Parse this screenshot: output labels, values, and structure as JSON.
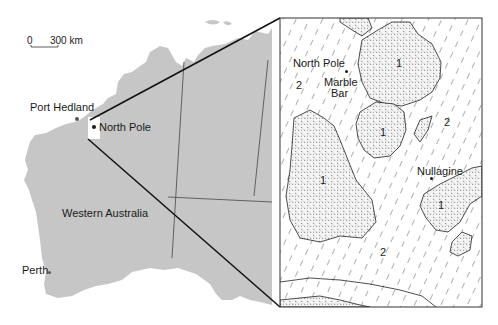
{
  "figure": {
    "overview_map": {
      "region_label": "Western Australia",
      "scale_bar": {
        "start": "0",
        "end": "300 km"
      },
      "places": [
        {
          "name": "Port Hedland"
        },
        {
          "name": "North Pole"
        },
        {
          "name": "Perth"
        }
      ],
      "colors": {
        "land": "#c6c6c6",
        "border": "#555555",
        "inset_marker": "#ffffff"
      }
    },
    "inset_map": {
      "places": [
        {
          "name": "North Pole"
        },
        {
          "name": "Marble"
        },
        {
          "name": "Bar"
        },
        {
          "name": "Nullagine"
        }
      ],
      "unit_labels": {
        "unit1": "1",
        "unit2": "2"
      },
      "legend_units": [
        {
          "id": "1",
          "pattern": "stippled (granitoid)"
        },
        {
          "id": "2",
          "pattern": "diagonal hatching (greenstone)"
        }
      ]
    }
  }
}
